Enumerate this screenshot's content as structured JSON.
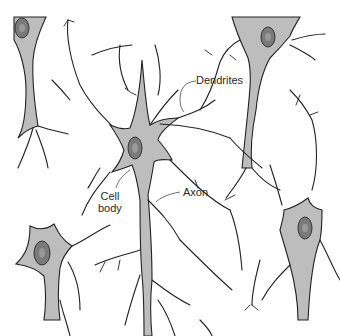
{
  "diagram": {
    "type": "neuron network illustration",
    "labels": {
      "dendrites": "Dendrites",
      "cell_body_line1": "Cell",
      "cell_body_line2": "body",
      "axon": "Axon"
    },
    "colors": {
      "background": "#ffffff",
      "cell_body_fill": "#bdbdbd",
      "nucleus_fill": "#7a7a7a",
      "outline": "#222222"
    },
    "neurons": [
      {
        "id": "top-left",
        "nucleus_center": [
          22,
          28
        ]
      },
      {
        "id": "top-right",
        "nucleus_center": [
          268,
          37
        ]
      },
      {
        "id": "center",
        "nucleus_center": [
          135,
          148
        ]
      },
      {
        "id": "bottom-left",
        "nucleus_center": [
          42,
          253
        ]
      },
      {
        "id": "right",
        "nucleus_center": [
          305,
          228
        ]
      }
    ]
  }
}
